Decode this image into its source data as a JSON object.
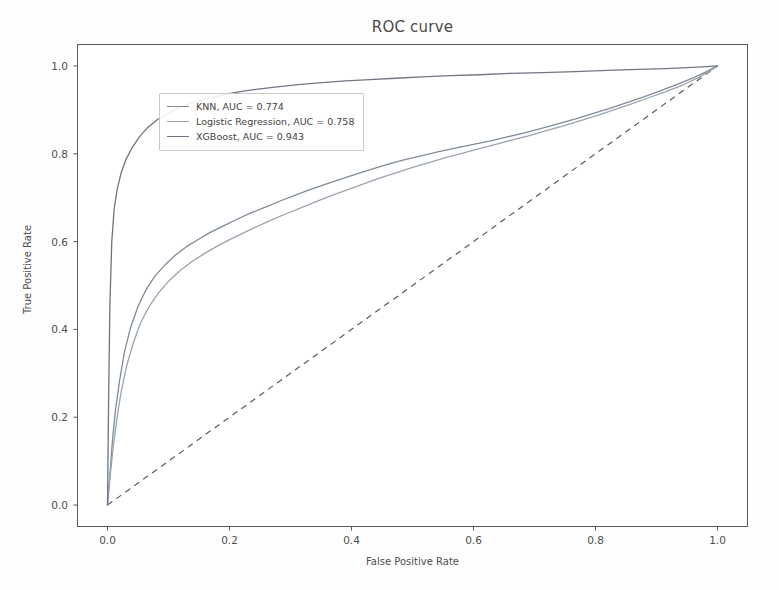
{
  "chart_data": {
    "type": "line",
    "title": "ROC curve",
    "xlabel": "False Positive Rate",
    "ylabel": "True Positive Rate",
    "xlim": [
      -0.05,
      1.05
    ],
    "ylim": [
      -0.05,
      1.05
    ],
    "xticks": [
      "0.0",
      "0.2",
      "0.4",
      "0.6",
      "0.8",
      "1.0"
    ],
    "xtick_values": [
      0.0,
      0.2,
      0.4,
      0.6,
      0.8,
      1.0
    ],
    "yticks": [
      "0.0",
      "0.2",
      "0.4",
      "0.6",
      "0.8",
      "1.0"
    ],
    "ytick_values": [
      0.0,
      0.2,
      0.4,
      0.6,
      0.8,
      1.0
    ],
    "grid": false,
    "legend_position": "upper left",
    "series": [
      {
        "name": "KNN",
        "auc": 0.774,
        "legend_label": "KNN, AUC = 0.774",
        "color": "#7f8b99",
        "linestyle": "solid",
        "x": [
          0.0,
          0.004,
          0.008,
          0.013,
          0.02,
          0.028,
          0.038,
          0.05,
          0.063,
          0.078,
          0.095,
          0.112,
          0.13,
          0.15,
          0.17,
          0.192,
          0.214,
          0.236,
          0.26,
          0.284,
          0.308,
          0.333,
          0.358,
          0.384,
          0.41,
          0.436,
          0.462,
          0.489,
          0.516,
          0.543,
          0.57,
          0.598,
          0.626,
          0.654,
          0.682,
          0.71,
          0.738,
          0.766,
          0.794,
          0.822,
          0.85,
          0.878,
          0.906,
          0.934,
          0.962,
          0.982,
          1.0
        ],
        "y": [
          0.0,
          0.07,
          0.145,
          0.215,
          0.285,
          0.35,
          0.405,
          0.452,
          0.49,
          0.522,
          0.548,
          0.57,
          0.589,
          0.606,
          0.622,
          0.637,
          0.652,
          0.666,
          0.679,
          0.693,
          0.706,
          0.719,
          0.731,
          0.743,
          0.755,
          0.766,
          0.777,
          0.787,
          0.796,
          0.805,
          0.813,
          0.821,
          0.829,
          0.838,
          0.847,
          0.857,
          0.868,
          0.879,
          0.891,
          0.903,
          0.916,
          0.929,
          0.943,
          0.958,
          0.974,
          0.987,
          1.0
        ]
      },
      {
        "name": "Logistic Regression",
        "auc": 0.758,
        "legend_label": "Logistic Regression, AUC = 0.758",
        "color": "#9aa4b0",
        "linestyle": "solid",
        "x": [
          0.0,
          0.004,
          0.009,
          0.015,
          0.022,
          0.031,
          0.042,
          0.054,
          0.068,
          0.084,
          0.101,
          0.119,
          0.138,
          0.158,
          0.179,
          0.201,
          0.223,
          0.246,
          0.27,
          0.294,
          0.319,
          0.344,
          0.369,
          0.395,
          0.421,
          0.447,
          0.474,
          0.5,
          0.527,
          0.554,
          0.581,
          0.608,
          0.635,
          0.662,
          0.69,
          0.718,
          0.746,
          0.774,
          0.802,
          0.83,
          0.858,
          0.886,
          0.914,
          0.942,
          0.968,
          0.986,
          1.0
        ],
        "y": [
          0.0,
          0.062,
          0.128,
          0.192,
          0.255,
          0.315,
          0.368,
          0.414,
          0.452,
          0.484,
          0.511,
          0.534,
          0.554,
          0.572,
          0.589,
          0.605,
          0.62,
          0.635,
          0.65,
          0.664,
          0.678,
          0.692,
          0.706,
          0.719,
          0.732,
          0.745,
          0.757,
          0.769,
          0.78,
          0.791,
          0.801,
          0.811,
          0.821,
          0.831,
          0.841,
          0.852,
          0.863,
          0.875,
          0.887,
          0.9,
          0.913,
          0.927,
          0.941,
          0.956,
          0.973,
          0.987,
          1.0
        ]
      },
      {
        "name": "XGBoost",
        "auc": 0.943,
        "legend_label": "XGBoost, AUC = 0.943",
        "color": "#6d7682",
        "linestyle": "solid",
        "x": [
          0.0,
          0.002,
          0.004,
          0.007,
          0.011,
          0.016,
          0.022,
          0.03,
          0.04,
          0.052,
          0.066,
          0.082,
          0.1,
          0.12,
          0.142,
          0.166,
          0.192,
          0.22,
          0.25,
          0.282,
          0.316,
          0.352,
          0.39,
          0.43,
          0.472,
          0.516,
          0.562,
          0.61,
          0.66,
          0.712,
          0.766,
          0.82,
          0.87,
          0.915,
          0.95,
          0.975,
          1.0
        ],
        "y": [
          0.0,
          0.26,
          0.46,
          0.6,
          0.675,
          0.72,
          0.755,
          0.786,
          0.813,
          0.838,
          0.86,
          0.878,
          0.893,
          0.906,
          0.917,
          0.927,
          0.935,
          0.942,
          0.948,
          0.953,
          0.958,
          0.962,
          0.966,
          0.969,
          0.972,
          0.975,
          0.978,
          0.98,
          0.983,
          0.985,
          0.987,
          0.99,
          0.992,
          0.994,
          0.996,
          0.998,
          1.0
        ]
      }
    ],
    "reference_line": {
      "name": "chance-diagonal",
      "linestyle": "dashed",
      "color": "#5a5a66",
      "x": [
        0.0,
        1.0
      ],
      "y": [
        0.0,
        1.0
      ]
    }
  }
}
